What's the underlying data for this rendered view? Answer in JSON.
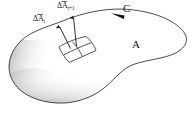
{
  "figure": {
    "background_color": "#ffffff",
    "stroke_color": "#2b2b2b",
    "shade_color": "#9a9a9a",
    "width": 193,
    "height": 127,
    "labels": {
      "curve": "C",
      "surface": "A",
      "delta_symbol": "Δ",
      "vector_letter": "A",
      "vector_i_subscript": "i",
      "vector_i_plus_1_subscript": "i+1",
      "vector_i_full": "ΔA⃗i",
      "vector_i_plus_1_full": "ΔA⃗i+1"
    },
    "elements": {
      "boundary_curve_name": "C",
      "surface_region_name": "A",
      "patch_grid_rows": 2,
      "patch_grid_cols": 2,
      "vector_count": 2,
      "direction_arrow": "leftward-along-top-of-curve"
    }
  }
}
